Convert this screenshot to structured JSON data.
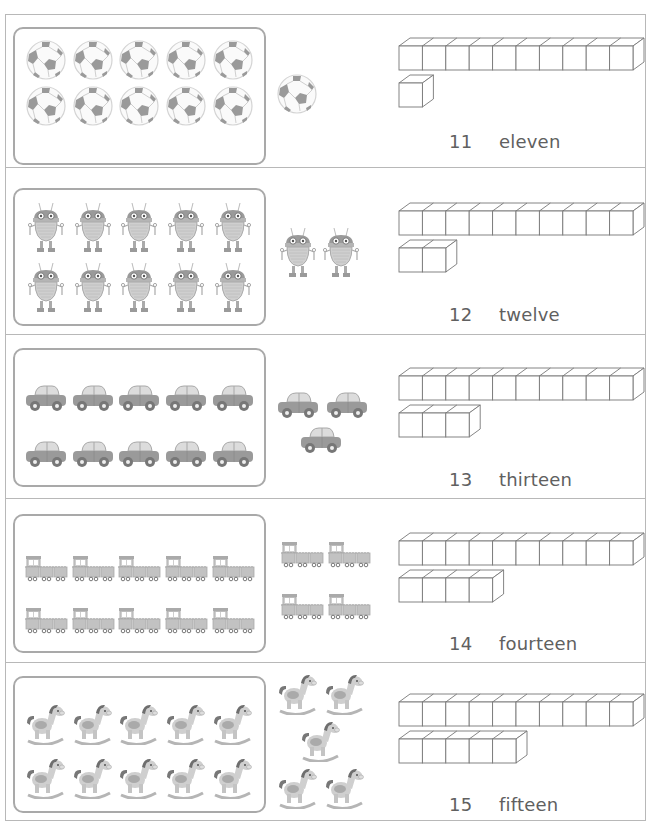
{
  "worksheet": {
    "topic": "Teen numbers 11-15",
    "colors": {
      "border": "#b8b8b8",
      "frame": "#a9a9a9",
      "object": "#9a9a9a",
      "object_light": "#cfcfcf",
      "text": "#606060"
    },
    "rows": [
      {
        "number": "11",
        "word": "eleven",
        "object": "soccer-ball",
        "tens": 10,
        "ones": 1
      },
      {
        "number": "12",
        "word": "twelve",
        "object": "robot",
        "tens": 10,
        "ones": 2
      },
      {
        "number": "13",
        "word": "thirteen",
        "object": "car",
        "tens": 10,
        "ones": 3
      },
      {
        "number": "14",
        "word": "fourteen",
        "object": "train",
        "tens": 10,
        "ones": 4
      },
      {
        "number": "15",
        "word": "fifteen",
        "object": "rocking-horse",
        "tens": 10,
        "ones": 5
      }
    ]
  }
}
